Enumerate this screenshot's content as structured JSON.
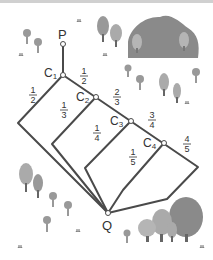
{
  "diagram": {
    "type": "path-network",
    "points": {
      "P": {
        "label": "P",
        "x": 63,
        "y": 44
      },
      "C1": {
        "label": "C",
        "sub": "1",
        "x": 63,
        "y": 75
      },
      "C2": {
        "label": "C",
        "sub": "2",
        "x": 96,
        "y": 97
      },
      "C3": {
        "label": "C",
        "sub": "3",
        "x": 131,
        "y": 121
      },
      "C4": {
        "label": "C",
        "sub": "4",
        "x": 164,
        "y": 143
      },
      "Q": {
        "label": "Q",
        "x": 108,
        "y": 213
      }
    },
    "fractions": [
      {
        "id": "c1-left",
        "num": "1",
        "den": "2"
      },
      {
        "id": "c1-right",
        "num": "1",
        "den": "2"
      },
      {
        "id": "c2-left",
        "num": "1",
        "den": "3"
      },
      {
        "id": "c2-right",
        "num": "2",
        "den": "3"
      },
      {
        "id": "c3-left",
        "num": "1",
        "den": "4"
      },
      {
        "id": "c3-right",
        "num": "3",
        "den": "4"
      },
      {
        "id": "c4-left",
        "num": "1",
        "den": "5"
      },
      {
        "id": "c4-right",
        "num": "4",
        "den": "5"
      }
    ],
    "colors": {
      "line": "#4a4a4a",
      "text": "#333333",
      "hill": "#8a8a8a",
      "tree": "#a8a8a8",
      "flower": "#9a9a9a",
      "grass": "#b0b0b0"
    }
  }
}
